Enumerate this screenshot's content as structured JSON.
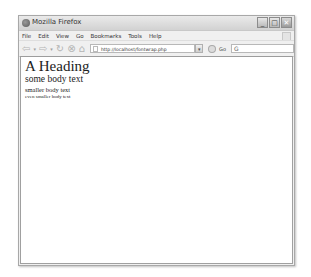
{
  "window": {
    "title": "Mozilla Firefox",
    "controls": {
      "minimize": "_",
      "maximize": "□",
      "close": "✕"
    }
  },
  "menubar": {
    "items": [
      "File",
      "Edit",
      "View",
      "Go",
      "Bookmarks",
      "Tools",
      "Help"
    ]
  },
  "toolbar": {
    "back": "⇦",
    "back_drop": "▾",
    "forward": "⇨",
    "forward_drop": "▾",
    "reload": "↻",
    "stop": "⊗",
    "home": "⌂",
    "url": "http://localhost/fontwrap.php",
    "url_dropdown": "▾",
    "go_label": "Go",
    "search_value": "G"
  },
  "page": {
    "heading": "A Heading",
    "body": "some body text",
    "smaller": "smaller body text",
    "even_smaller": "even smaller body text"
  }
}
